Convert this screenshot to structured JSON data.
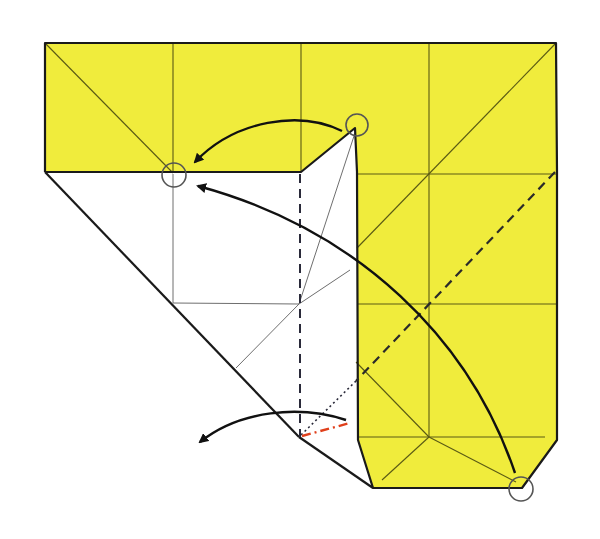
{
  "diagram": {
    "type": "origami-fold-step",
    "canvas": {
      "width": 600,
      "height": 539,
      "background": "#ffffff"
    },
    "colors": {
      "paper_colored": "#f0ec3c",
      "paper_white": "#ffffff",
      "edge": "#1a1a1a",
      "crease": "#5a5a14",
      "crease_on_white": "#6e6e6e",
      "valley_fold": "#2a2a3a",
      "mountain_fold": "#e0401c",
      "arrow": "#111111",
      "marker_circle": "#555555"
    },
    "shapes": {
      "yellow_top_band": "45,43 556,43 556,172 355,172 355,128 301,172 45,172",
      "yellow_right_panel": "356,172 557,172 557,440 522,488 373,488 358,440",
      "white_flap": "45,172 301,172 355,128 356,172 358,440 373,488 299,437"
    },
    "markers": [
      {
        "name": "target-point-circle",
        "cx": 174,
        "cy": 175,
        "r": 12
      },
      {
        "name": "flap-tip-circle",
        "cx": 357,
        "cy": 125,
        "r": 11
      },
      {
        "name": "bottom-corner-circle",
        "cx": 521,
        "cy": 489,
        "r": 12
      }
    ],
    "arrows": [
      {
        "name": "fold-flap-tip-arrow",
        "from": [
          342,
          131
        ],
        "to": [
          190,
          163
        ],
        "meaning": "bring flap tip to circled point"
      },
      {
        "name": "fold-bottom-corner-arrow",
        "from": [
          515,
          475
        ],
        "to": [
          190,
          185
        ],
        "meaning": "bring bottom corner to circled point"
      },
      {
        "name": "swing-left-arrow",
        "from": [
          345,
          420
        ],
        "to": [
          197,
          445
        ],
        "meaning": "unfold / swing layer to the left"
      }
    ],
    "fold_lines": [
      {
        "name": "valley-fold-vertical",
        "style": "dashed",
        "from": [
          300,
          172
        ],
        "to": [
          300,
          437
        ]
      },
      {
        "name": "valley-fold-diagonal",
        "style": "dashed",
        "from": [
          555,
          172
        ],
        "to": [
          356,
          381
        ]
      },
      {
        "name": "hidden-fold-diagonal",
        "style": "dotted",
        "from": [
          356,
          381
        ],
        "to": [
          300,
          437
        ]
      },
      {
        "name": "mountain-fold-short",
        "style": "dash-dot",
        "from": [
          300,
          437
        ],
        "to": [
          350,
          422
        ]
      }
    ],
    "grid": {
      "verticals_x": [
        173,
        301,
        429
      ],
      "horizontals_y": [
        174,
        304,
        437
      ]
    }
  }
}
